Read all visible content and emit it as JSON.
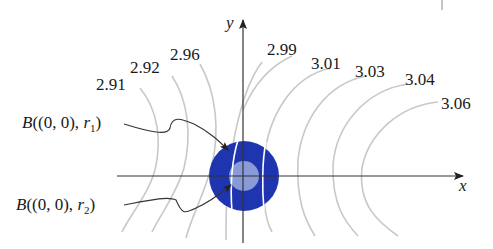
{
  "figure": {
    "axes": {
      "x_label": "x",
      "y_label": "y"
    },
    "contour_labels": [
      "2.91",
      "2.92",
      "2.96",
      "2.99",
      "3.01",
      "3.03",
      "3.04",
      "3.06"
    ],
    "balls": [
      {
        "label_prefix": "B((0, 0), ",
        "radius_symbol": "r",
        "radius_index": "1",
        "label_suffix": ")",
        "color": "#1f35b0"
      },
      {
        "label_prefix": "B((0, 0), ",
        "radius_symbol": "r",
        "radius_index": "2",
        "label_suffix": ")",
        "color": "#8a9ad8"
      }
    ]
  },
  "colors": {
    "outer_ball": "#1f35b0",
    "inner_ball": "#8a9ad8",
    "contour": "#c8c8c8",
    "axis": "#333333"
  }
}
